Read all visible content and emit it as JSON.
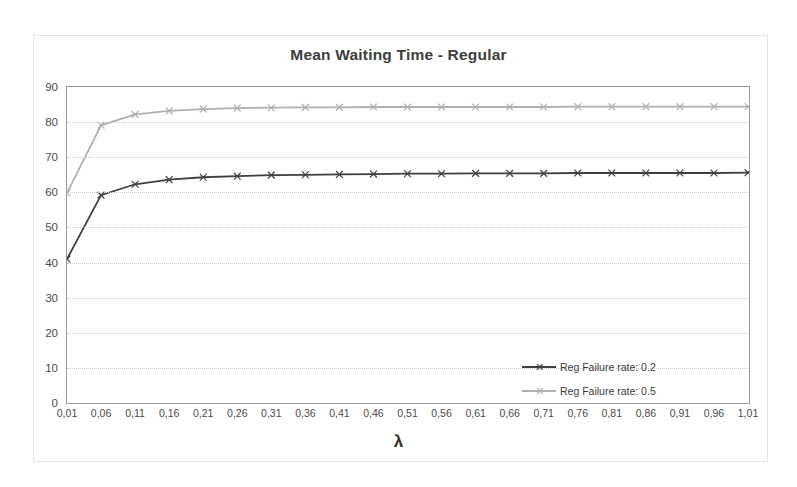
{
  "chart_data": {
    "type": "line",
    "title": "Mean Waiting Time - Regular",
    "xlabel": "λ",
    "ylabel": "",
    "xlim": [
      0.01,
      1.01
    ],
    "ylim": [
      0,
      90
    ],
    "grid": "horizontal-dotted",
    "legend_position": "inside-center-left",
    "categories": [
      "0,01",
      "0,06",
      "0,11",
      "0,16",
      "0,21",
      "0,26",
      "0,31",
      "0,36",
      "0,41",
      "0,46",
      "0,51",
      "0,56",
      "0,61",
      "0,66",
      "0,71",
      "0,76",
      "0,81",
      "0,86",
      "0,91",
      "0,96",
      "1,01"
    ],
    "ytick_labels": [
      "0",
      "10",
      "20",
      "30",
      "40",
      "50",
      "60",
      "70",
      "80",
      "90"
    ],
    "ytick_values": [
      0,
      10,
      20,
      30,
      40,
      50,
      60,
      70,
      80,
      90
    ],
    "series": [
      {
        "name": "Reg Failure rate: 0.2",
        "color": "#3f3f3f",
        "marker": "x",
        "values": [
          41.0,
          59.2,
          62.3,
          63.6,
          64.3,
          64.6,
          64.9,
          65.0,
          65.1,
          65.2,
          65.3,
          65.3,
          65.4,
          65.4,
          65.4,
          65.5,
          65.5,
          65.5,
          65.5,
          65.5,
          65.6
        ]
      },
      {
        "name": "Reg Failure rate: 0.5",
        "color": "#b0b0b0",
        "marker": "x",
        "values": [
          59.8,
          79.1,
          82.2,
          83.2,
          83.7,
          84.0,
          84.1,
          84.2,
          84.2,
          84.3,
          84.3,
          84.3,
          84.3,
          84.3,
          84.3,
          84.4,
          84.4,
          84.4,
          84.4,
          84.4,
          84.4
        ]
      }
    ]
  },
  "legend": {
    "items": [
      {
        "label": "Reg Failure rate: 0.2"
      },
      {
        "label": "Reg Failure rate: 0.5"
      }
    ]
  }
}
